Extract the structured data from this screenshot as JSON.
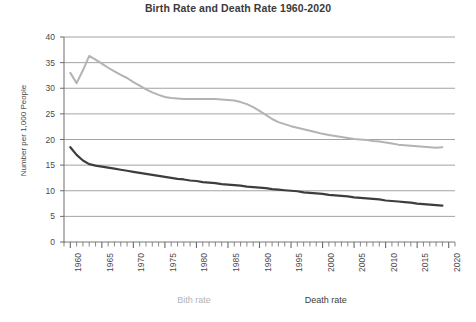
{
  "chart_data": {
    "type": "line",
    "title": "Birth Rate and Death Rate 1960-2020",
    "xlabel": "",
    "ylabel": "Number per 1,000 People",
    "xlim": [
      1959,
      2021
    ],
    "ylim": [
      0,
      40
    ],
    "ytick_labels": [
      "40",
      "35",
      "30",
      "25",
      "20",
      "15",
      "10",
      "5",
      "0"
    ],
    "ytick_values": [
      40,
      35,
      30,
      25,
      20,
      15,
      10,
      5,
      0
    ],
    "xtick_labels": [
      "1960",
      "1965",
      "1970",
      "1975",
      "1980",
      "1985",
      "1990",
      "1995",
      "2000",
      "2005",
      "2010",
      "2015",
      "2020"
    ],
    "xtick_values": [
      1960,
      1965,
      1970,
      1975,
      1980,
      1985,
      1990,
      1995,
      2000,
      2005,
      2010,
      2015,
      2020
    ],
    "minor_tick_step": 1,
    "grid": "horizontal",
    "legend_position": "bottom",
    "x": [
      1960,
      1961,
      1962,
      1963,
      1964,
      1965,
      1966,
      1967,
      1968,
      1969,
      1970,
      1971,
      1972,
      1973,
      1974,
      1975,
      1976,
      1977,
      1978,
      1979,
      1980,
      1981,
      1982,
      1983,
      1984,
      1985,
      1986,
      1987,
      1988,
      1989,
      1990,
      1991,
      1992,
      1993,
      1994,
      1995,
      1996,
      1997,
      1998,
      1999,
      2000,
      2001,
      2002,
      2003,
      2004,
      2005,
      2006,
      2007,
      2008,
      2009,
      2010,
      2011,
      2012,
      2013,
      2014,
      2015,
      2016,
      2017,
      2018,
      2019
    ],
    "series": [
      {
        "name": "Bith rate",
        "color": "#b3b3b3",
        "width": 2.0,
        "values": [
          33.0,
          31.0,
          33.5,
          36.3,
          35.6,
          34.8,
          34.0,
          33.3,
          32.6,
          32.0,
          31.2,
          30.5,
          29.8,
          29.2,
          28.7,
          28.3,
          28.1,
          28.0,
          27.9,
          27.9,
          27.9,
          27.9,
          27.9,
          27.9,
          27.8,
          27.7,
          27.6,
          27.3,
          26.9,
          26.3,
          25.6,
          24.8,
          24.0,
          23.4,
          23.0,
          22.6,
          22.3,
          22.0,
          21.7,
          21.4,
          21.1,
          20.9,
          20.7,
          20.5,
          20.3,
          20.1,
          20.0,
          19.9,
          19.7,
          19.6,
          19.4,
          19.2,
          19.0,
          18.9,
          18.8,
          18.7,
          18.6,
          18.5,
          18.4,
          18.5
        ]
      },
      {
        "name": "Death rate",
        "color": "#3d3d3d",
        "width": 2.2,
        "values": [
          18.5,
          17.0,
          15.9,
          15.2,
          14.9,
          14.7,
          14.5,
          14.3,
          14.1,
          13.9,
          13.7,
          13.5,
          13.3,
          13.1,
          12.9,
          12.7,
          12.5,
          12.3,
          12.2,
          12.0,
          11.9,
          11.7,
          11.6,
          11.5,
          11.3,
          11.2,
          11.1,
          11.0,
          10.8,
          10.7,
          10.6,
          10.5,
          10.3,
          10.2,
          10.1,
          10.0,
          9.9,
          9.7,
          9.6,
          9.5,
          9.4,
          9.2,
          9.1,
          9.0,
          8.9,
          8.7,
          8.6,
          8.5,
          8.4,
          8.3,
          8.1,
          8.0,
          7.9,
          7.8,
          7.7,
          7.5,
          7.4,
          7.3,
          7.2,
          7.1
        ]
      }
    ]
  },
  "legend": {
    "entries": [
      {
        "label": "Bith rate",
        "color": "#b3b3b3"
      },
      {
        "label": "Death rate",
        "color": "#3d3d3d"
      }
    ]
  },
  "axes": {
    "grid_color": "#8c8c8c",
    "axis_color": "#7a7a7a",
    "tick_color": "#6b6b6b"
  }
}
